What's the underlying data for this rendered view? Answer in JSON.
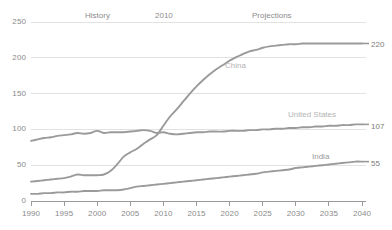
{
  "chart_data": {
    "type": "line",
    "title": "",
    "subtitle": "",
    "xlabel": "",
    "ylabel": "",
    "xlim": [
      1990,
      2040
    ],
    "ylim": [
      0,
      250
    ],
    "grid": true,
    "legend_position": "inline-right",
    "x_ticks": [
      "1990",
      "1995",
      "2000",
      "2005",
      "2010",
      "2015",
      "2020",
      "2025",
      "2030",
      "2035",
      "2040"
    ],
    "y_ticks": [
      "0",
      "50",
      "100",
      "150",
      "200",
      "250"
    ],
    "annotations": [
      {
        "name": "history",
        "text": "History",
        "x": 1997
      },
      {
        "name": "divider-year",
        "text": "2010",
        "x": 2010
      },
      {
        "name": "projections",
        "text": "Projections",
        "x": 2024
      }
    ],
    "x": [
      1990,
      1991,
      1992,
      1993,
      1994,
      1995,
      1996,
      1997,
      1998,
      1999,
      2000,
      2001,
      2002,
      2003,
      2004,
      2005,
      2006,
      2007,
      2008,
      2009,
      2010,
      2011,
      2012,
      2013,
      2014,
      2015,
      2016,
      2017,
      2018,
      2019,
      2020,
      2021,
      2022,
      2023,
      2024,
      2025,
      2026,
      2027,
      2028,
      2029,
      2030,
      2031,
      2032,
      2033,
      2034,
      2035,
      2036,
      2037,
      2038,
      2039,
      2040
    ],
    "series": [
      {
        "name": "China",
        "color": "#9a9a9a",
        "end_value": 220,
        "label": "China",
        "label_x": 2018,
        "label_y": 178,
        "values": [
          27,
          28,
          29,
          30,
          31,
          32,
          34,
          37,
          36,
          36,
          36,
          37,
          42,
          51,
          62,
          68,
          73,
          80,
          86,
          92,
          105,
          118,
          128,
          139,
          150,
          160,
          169,
          177,
          184,
          190,
          196,
          201,
          205,
          209,
          211,
          214,
          216,
          217,
          218,
          219,
          219,
          220,
          220,
          220,
          220,
          220,
          220,
          220,
          220,
          220,
          220
        ]
      },
      {
        "name": "United States",
        "color": "#9a9a9a",
        "end_value": 107,
        "label": "United States",
        "label_x": 2031,
        "label_y": 122,
        "values": [
          84,
          86,
          88,
          89,
          91,
          92,
          93,
          95,
          94,
          95,
          98,
          95,
          96,
          96,
          96,
          97,
          98,
          99,
          98,
          95,
          96,
          94,
          93,
          94,
          95,
          96,
          96,
          97,
          97,
          97,
          98,
          98,
          98,
          99,
          99,
          100,
          100,
          101,
          101,
          102,
          102,
          103,
          103,
          104,
          104,
          105,
          105,
          106,
          106,
          107,
          107
        ]
      },
      {
        "name": "India",
        "color": "#9a9a9a",
        "end_value": 55,
        "label": "India",
        "label_x": 2034,
        "label_y": 66,
        "values": [
          10,
          10,
          11,
          11,
          12,
          12,
          13,
          13,
          14,
          14,
          14,
          15,
          15,
          15,
          16,
          18,
          20,
          21,
          22,
          23,
          24,
          25,
          26,
          27,
          28,
          29,
          30,
          31,
          32,
          33,
          34,
          35,
          36,
          37,
          38,
          40,
          41,
          42,
          43,
          44,
          46,
          47,
          48,
          49,
          50,
          51,
          52,
          53,
          54,
          55,
          55
        ]
      }
    ]
  },
  "axis": {
    "y_labels": [
      "250",
      "200",
      "150",
      "100",
      "50",
      "0"
    ],
    "x_labels": [
      "1990",
      "1995",
      "2000",
      "2005",
      "2010",
      "2015",
      "2020",
      "2025",
      "2030",
      "2035",
      "2040"
    ]
  },
  "end_labels": [
    {
      "name": "china-end-value",
      "text": "220"
    },
    {
      "name": "united-states-end-value",
      "text": "107"
    },
    {
      "name": "india-end-value",
      "text": "55"
    }
  ],
  "period_labels": [
    {
      "name": "history-label",
      "text": "History"
    },
    {
      "name": "divider-year-label",
      "text": "2010"
    },
    {
      "name": "projections-label",
      "text": "Projections"
    }
  ],
  "series_labels": [
    {
      "name": "china-series-label",
      "text": "China"
    },
    {
      "name": "united-states-series-label",
      "text": "United States"
    },
    {
      "name": "india-series-label",
      "text": "India"
    }
  ],
  "colors": {
    "line": "#9a9a9a",
    "grid": "#e2e2e2",
    "axis": "#9a9a9a",
    "tick_text": "#8a8a8a",
    "series_label": "#b8b8b8",
    "background": "#ffffff"
  }
}
